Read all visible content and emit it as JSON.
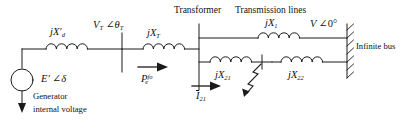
{
  "diagram": {
    "title_hidden": "Single machine infinite bus power system with fault on line 2",
    "type": "power-system-one-line-diagram",
    "stroke_color": "#1a1a1a",
    "background": "#ffffff"
  },
  "section_labels": {
    "transformer": "Transformer",
    "transmission_lines": "Transmission lines"
  },
  "components": {
    "generator_reactance": {
      "label_base": "jX",
      "sub": "d",
      "prime": "′"
    },
    "transformer_reactance": {
      "label_base": "jX",
      "sub": "T"
    },
    "line1_reactance": {
      "label_base": "jX",
      "sub": "1"
    },
    "line21_reactance": {
      "label_base": "jX",
      "sub": "21"
    },
    "line22_reactance": {
      "label_base": "jX",
      "sub": "22"
    },
    "generator_source": {
      "label_base": "E",
      "prime": "′",
      "angle": "∠",
      "phase": "δ"
    },
    "infinite_bus_source": {
      "label_base": "V",
      "angle": "∠",
      "phase": "0°"
    },
    "terminal_voltage": {
      "label_base": "V",
      "sub": "T",
      "angle": "∠",
      "phase": "θ",
      "phase_sub": "T"
    },
    "electrical_power": {
      "label_base": "P",
      "sub": "e",
      "sup": "fo"
    },
    "line_current": {
      "label_base": "I",
      "sub": "21"
    }
  },
  "annotations": {
    "generator_caption_line1": "Generator",
    "generator_caption_line2": "internal voltage",
    "infinite_bus_caption": "Infinite bus"
  }
}
